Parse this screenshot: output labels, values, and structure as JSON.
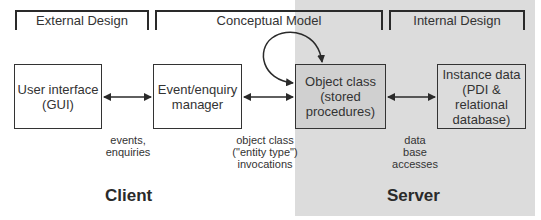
{
  "brackets": [
    {
      "label": "External Design"
    },
    {
      "label": "Conceptual Model"
    },
    {
      "label": "Internal Design"
    }
  ],
  "boxes": [
    {
      "label": "User interface\n(GUI)"
    },
    {
      "label": "Event/enquiry\nmanager"
    },
    {
      "label": "Object class\n(stored\nprocedures)"
    },
    {
      "label": "Instance data\n(PDI &\nrelational\ndatabase)"
    }
  ],
  "connectors": [
    {
      "label": "events,\nenquiries"
    },
    {
      "label": "object class\n(\"entity type\")\ninvocations"
    },
    {
      "label": "data\nbase\naccesses"
    }
  ],
  "zones": {
    "client": "Client",
    "server": "Server"
  },
  "colors": {
    "server_zone": "#dcdcdc",
    "object_box_fill": "#d0d0d0",
    "line": "#2a2a2a"
  }
}
